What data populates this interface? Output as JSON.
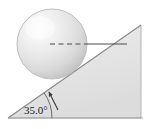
{
  "figure": {
    "angle_label": "35.0°",
    "colors": {
      "background": "#ffffff",
      "incline_fill": "#e4e4e4",
      "incline_edge": "#9a9a9a",
      "sphere_light": "#fbfbfb",
      "sphere_mid": "#e0e0e0",
      "sphere_dark": "#c3c3c3",
      "sphere_edge": "#b4b4b4",
      "line": "#4a4a4a",
      "text": "#1a1a1a"
    },
    "geometry": {
      "incline_angle_deg": 35.0,
      "base_left_x": 8,
      "base_y": 118,
      "base_right_x": 141,
      "apex_x": 141,
      "apex_y": 25,
      "sphere_center_x": 52,
      "sphere_center_y": 44,
      "sphere_radius": 35,
      "center_line_start_x": 50,
      "center_line_end_x": 127,
      "center_line_y": 44,
      "dash_segment_end_x": 88,
      "arc_radius": 44,
      "arrow_tip_x": 49,
      "arrow_tip_y": 92
    },
    "elements": {
      "sphere_name": "sphere-ball",
      "incline_name": "inclined-plane",
      "dashed_line_name": "center-horizontal-dashed-line",
      "solid_line_name": "center-horizontal-solid-line",
      "arc_name": "angle-arc",
      "arrow_name": "angle-arrow",
      "baseline_name": "ground-baseline"
    }
  }
}
